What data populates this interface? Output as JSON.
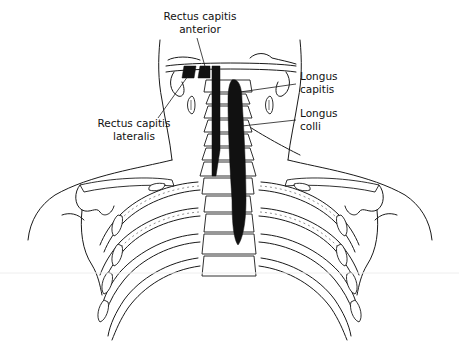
{
  "figure": {
    "labels": {
      "rectus_capitis_anterior": "Rectus capitis\nanterior",
      "rectus_capitis_anterior_line1": "Rectus capitis",
      "rectus_capitis_anterior_line2": "anterior",
      "rectus_capitis_lateralis_line1": "Rectus capitis",
      "rectus_capitis_lateralis_line2": "lateralis",
      "longus_capitis_line1": "Longus",
      "longus_capitis_line2": "capitis",
      "longus_colli_line1": "Longus",
      "longus_colli_line2": "colli"
    },
    "colors": {
      "background": "#ffffff",
      "ink": "#111111",
      "muscle_fill": "#111111"
    }
  }
}
